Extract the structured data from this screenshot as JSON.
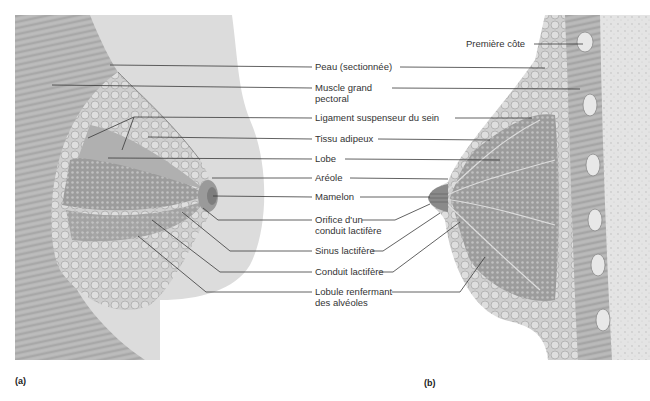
{
  "figure": {
    "panels": [
      {
        "id": "a",
        "label": "(a)",
        "view": "anterior"
      },
      {
        "id": "b",
        "label": "(b)",
        "view": "sagittal"
      }
    ],
    "labels": [
      {
        "id": "peau",
        "text": "Peau (sectionnée)"
      },
      {
        "id": "muscle_1",
        "text": "Muscle grand"
      },
      {
        "id": "muscle_2",
        "text": "pectoral"
      },
      {
        "id": "ligament",
        "text": "Ligament suspenseur du sein"
      },
      {
        "id": "tissu",
        "text": "Tissu adipeux"
      },
      {
        "id": "lobe",
        "text": "Lobe"
      },
      {
        "id": "areole",
        "text": "Aréole"
      },
      {
        "id": "mamelon",
        "text": "Mamelon"
      },
      {
        "id": "orifice_1",
        "text": "Orifice d'un"
      },
      {
        "id": "orifice_2",
        "text": "conduit lactifère"
      },
      {
        "id": "sinus",
        "text": "Sinus lactifère"
      },
      {
        "id": "conduit",
        "text": "Conduit lactifère"
      },
      {
        "id": "lobule_1",
        "text": "Lobule renfermant"
      },
      {
        "id": "lobule_2",
        "text": "des alvéoles"
      },
      {
        "id": "cote",
        "text": "Première côte"
      }
    ],
    "colors": {
      "skin": "#d9d9d9",
      "muscle": "#a8a8a8",
      "gland": "#8f8f8f",
      "fat": "#c4c4c4",
      "leader": "#3a3a3a",
      "bone": "#e6e6e6"
    }
  }
}
